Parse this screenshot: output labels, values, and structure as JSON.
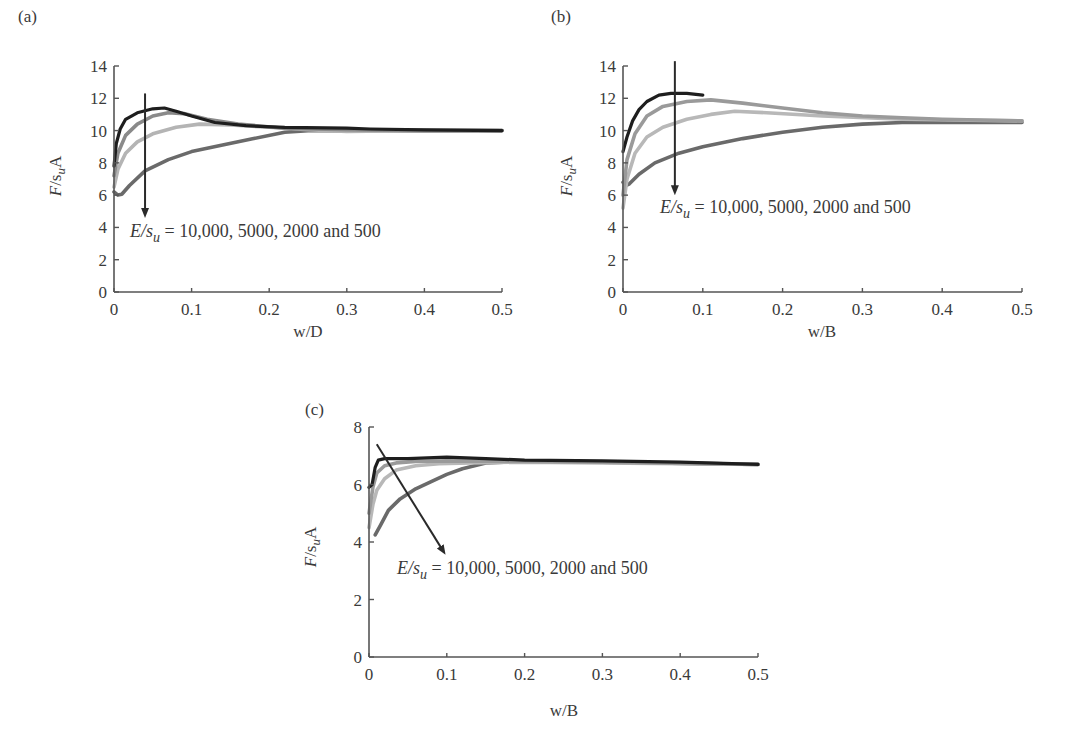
{
  "figure": {
    "panels": [
      "(a)",
      "(b)",
      "(c)"
    ]
  },
  "chart_data": [
    {
      "type": "line",
      "panel": "(a)",
      "xlabel": "w/D",
      "ylabel": "F/s_uA",
      "xlim": [
        0,
        0.5
      ],
      "ylim": [
        0,
        14
      ],
      "xticks": [
        "0",
        "0.1",
        "0.2",
        "0.3",
        "0.4",
        "0.5"
      ],
      "yticks": [
        "0",
        "2",
        "4",
        "6",
        "8",
        "10",
        "12",
        "14"
      ],
      "annotation": "E/s_u = 10,000, 5000, 2000 and 500",
      "annotation_parts": {
        "lhs_E": "E/s",
        "lhs_sub": "u",
        "rhs": " = 10,000, 5000, 2000 and 500"
      },
      "grid": false,
      "series": [
        {
          "name": "E/su=10000",
          "color": "#1e1e1e",
          "x": [
            0,
            0.003,
            0.008,
            0.015,
            0.03,
            0.05,
            0.065,
            0.08,
            0.1,
            0.13,
            0.17,
            0.22,
            0.3,
            0.33,
            0.4,
            0.5
          ],
          "y": [
            7.8,
            9.2,
            10.1,
            10.7,
            11.1,
            11.35,
            11.4,
            11.2,
            10.9,
            10.5,
            10.3,
            10.2,
            10.15,
            10.1,
            10.05,
            10.0
          ]
        },
        {
          "name": "E/su=5000",
          "color": "#8a8a8a",
          "x": [
            0,
            0.005,
            0.015,
            0.03,
            0.05,
            0.07,
            0.09,
            0.12,
            0.16,
            0.22,
            0.3,
            0.4,
            0.5
          ],
          "y": [
            7.2,
            8.6,
            9.7,
            10.4,
            10.9,
            11.1,
            11.05,
            10.7,
            10.4,
            10.15,
            10.05,
            10.0,
            10.0
          ]
        },
        {
          "name": "E/su=2000",
          "color": "#b4b4b4",
          "x": [
            0,
            0.005,
            0.015,
            0.03,
            0.05,
            0.08,
            0.11,
            0.15,
            0.2,
            0.25,
            0.3,
            0.38,
            0.5
          ],
          "y": [
            6.5,
            7.6,
            8.6,
            9.3,
            9.8,
            10.2,
            10.4,
            10.35,
            10.2,
            10.05,
            9.95,
            10.0,
            10.0
          ]
        },
        {
          "name": "E/su=500",
          "color": "#6a6a6a",
          "x": [
            0,
            0.005,
            0.01,
            0.02,
            0.04,
            0.07,
            0.1,
            0.14,
            0.18,
            0.22,
            0.25,
            0.3,
            0.4,
            0.5
          ],
          "y": [
            6.2,
            6.0,
            6.05,
            6.6,
            7.5,
            8.2,
            8.7,
            9.1,
            9.5,
            9.9,
            10.0,
            10.0,
            10.0,
            10.0
          ]
        }
      ],
      "arrow": {
        "from": [
          0.04,
          12.3
        ],
        "to": [
          0.04,
          4.9
        ]
      }
    },
    {
      "type": "line",
      "panel": "(b)",
      "xlabel": "w/B",
      "ylabel": "F/s_uA",
      "xlim": [
        0,
        0.5
      ],
      "ylim": [
        0,
        14
      ],
      "xticks": [
        "0",
        "0.1",
        "0.2",
        "0.3",
        "0.4",
        "0.5"
      ],
      "yticks": [
        "0",
        "2",
        "4",
        "6",
        "8",
        "10",
        "12",
        "14"
      ],
      "annotation": "E/s_u = 10,000, 5000, 2000 and 500",
      "annotation_parts": {
        "lhs_E": "E/s",
        "lhs_sub": "u",
        "rhs": " = 10,000, 5000, 2000 and 500"
      },
      "grid": false,
      "series": [
        {
          "name": "E/su=10000",
          "color": "#1e1e1e",
          "x": [
            0,
            0.005,
            0.012,
            0.02,
            0.03,
            0.045,
            0.06,
            0.08,
            0.1
          ],
          "y": [
            8.7,
            9.6,
            10.6,
            11.3,
            11.8,
            12.2,
            12.3,
            12.3,
            12.2
          ]
        },
        {
          "name": "E/su=5000",
          "color": "#9a9a9a",
          "x": [
            0,
            0.005,
            0.015,
            0.03,
            0.05,
            0.08,
            0.11,
            0.15,
            0.2,
            0.25,
            0.3,
            0.35,
            0.4,
            0.5
          ],
          "y": [
            6.0,
            8.2,
            9.8,
            10.9,
            11.5,
            11.8,
            11.9,
            11.7,
            11.4,
            11.1,
            10.9,
            10.8,
            10.7,
            10.6
          ]
        },
        {
          "name": "E/su=2000",
          "color": "#b8b8b8",
          "x": [
            0,
            0.005,
            0.015,
            0.03,
            0.05,
            0.08,
            0.11,
            0.14,
            0.18,
            0.25,
            0.35,
            0.5
          ],
          "y": [
            5.2,
            7.0,
            8.6,
            9.6,
            10.2,
            10.7,
            11.0,
            11.2,
            11.1,
            10.9,
            10.7,
            10.6
          ]
        },
        {
          "name": "E/su=500",
          "color": "#6a6a6a",
          "x": [
            0,
            0.004,
            0.008,
            0.02,
            0.04,
            0.07,
            0.1,
            0.15,
            0.2,
            0.25,
            0.3,
            0.35,
            0.4,
            0.5
          ],
          "y": [
            6.8,
            6.6,
            6.7,
            7.3,
            8.0,
            8.6,
            9.0,
            9.5,
            9.9,
            10.2,
            10.4,
            10.5,
            10.5,
            10.5
          ]
        }
      ],
      "arrow": {
        "from": [
          0.065,
          14.3
        ],
        "to": [
          0.065,
          6.3
        ]
      }
    },
    {
      "type": "line",
      "panel": "(c)",
      "xlabel": "w/B",
      "ylabel": "F/s_uA",
      "xlim": [
        0,
        0.5
      ],
      "ylim": [
        0,
        8
      ],
      "xticks": [
        "0",
        "0.1",
        "0.2",
        "0.3",
        "0.4",
        "0.5"
      ],
      "yticks": [
        "0",
        "2",
        "4",
        "6",
        "8"
      ],
      "annotation": "E/s_u = 10,000, 5000, 2000 and 500",
      "annotation_parts": {
        "lhs_E": "E/s",
        "lhs_sub": "u",
        "rhs": " = 10,000, 5000, 2000 and 500"
      },
      "grid": false,
      "series": [
        {
          "name": "E/su=10000",
          "color": "#1e1e1e",
          "x": [
            0,
            0.004,
            0.008,
            0.012,
            0.02,
            0.05,
            0.1,
            0.15,
            0.2,
            0.3,
            0.4,
            0.5
          ],
          "y": [
            5.9,
            6.0,
            6.6,
            6.85,
            6.9,
            6.9,
            6.95,
            6.9,
            6.85,
            6.82,
            6.78,
            6.7
          ]
        },
        {
          "name": "E/su=5000",
          "color": "#9a9a9a",
          "x": [
            0,
            0.005,
            0.01,
            0.02,
            0.035,
            0.06,
            0.1,
            0.2,
            0.3,
            0.5
          ],
          "y": [
            5.0,
            5.9,
            6.4,
            6.65,
            6.75,
            6.8,
            6.82,
            6.8,
            6.78,
            6.7
          ]
        },
        {
          "name": "E/su=2000",
          "color": "#b8b8b8",
          "x": [
            0,
            0.005,
            0.01,
            0.02,
            0.035,
            0.06,
            0.09,
            0.13,
            0.2,
            0.3,
            0.5
          ],
          "y": [
            4.5,
            5.3,
            5.8,
            6.2,
            6.5,
            6.65,
            6.72,
            6.75,
            6.78,
            6.75,
            6.7
          ]
        },
        {
          "name": "E/su=500",
          "color": "#6a6a6a",
          "x": [
            0.008,
            0.015,
            0.025,
            0.04,
            0.06,
            0.08,
            0.1,
            0.12,
            0.15,
            0.2,
            0.3,
            0.5
          ],
          "y": [
            4.25,
            4.6,
            5.1,
            5.5,
            5.85,
            6.1,
            6.35,
            6.55,
            6.75,
            6.8,
            6.78,
            6.7
          ]
        }
      ],
      "arrow": {
        "from": [
          0.01,
          7.4
        ],
        "to": [
          0.095,
          3.7
        ]
      }
    }
  ]
}
